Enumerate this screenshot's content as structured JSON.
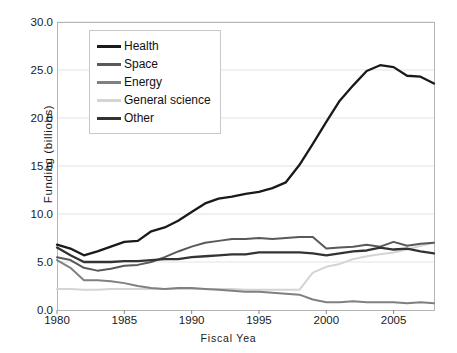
{
  "chart_data": {
    "type": "line",
    "title": "",
    "xlabel": "Fiscal Yea",
    "ylabel": "Funding (billions)",
    "xlim": [
      1980,
      2008
    ],
    "ylim": [
      0.0,
      30.0
    ],
    "grid": true,
    "legend_position": "top-left-inside",
    "x_ticks": [
      "1980",
      "1985",
      "1990",
      "1995",
      "2000",
      "2005"
    ],
    "x_tick_values": [
      1980,
      1985,
      1990,
      1995,
      2000,
      2005
    ],
    "y_ticks": [
      "0.0",
      "5.0",
      "10.0",
      "15.0",
      "20.0",
      "25.0",
      "30.0"
    ],
    "y_tick_values": [
      0.0,
      5.0,
      10.0,
      15.0,
      20.0,
      25.0,
      30.0
    ],
    "x": [
      1980,
      1981,
      1982,
      1983,
      1984,
      1985,
      1986,
      1987,
      1988,
      1989,
      1990,
      1991,
      1992,
      1993,
      1994,
      1995,
      1996,
      1997,
      1998,
      1999,
      2000,
      2001,
      2002,
      2003,
      2004,
      2005,
      2006,
      2007,
      2008
    ],
    "series": [
      {
        "name": "Health",
        "color": "#1a1a1a",
        "values": [
          6.8,
          6.4,
          5.7,
          6.1,
          6.6,
          7.1,
          7.2,
          8.2,
          8.6,
          9.3,
          10.2,
          11.1,
          11.6,
          11.8,
          12.1,
          12.3,
          12.7,
          13.3,
          15.1,
          17.3,
          19.6,
          21.8,
          23.4,
          24.9,
          25.5,
          25.3,
          24.4,
          24.3,
          23.6
        ]
      },
      {
        "name": "Space",
        "color": "#595959",
        "values": [
          5.5,
          5.2,
          4.4,
          4.1,
          4.3,
          4.6,
          4.7,
          5.0,
          5.5,
          6.1,
          6.6,
          7.0,
          7.2,
          7.4,
          7.4,
          7.5,
          7.4,
          7.5,
          7.6,
          7.6,
          6.4,
          6.5,
          6.6,
          6.8,
          6.6,
          7.1,
          6.7,
          6.9,
          7.0
        ]
      },
      {
        "name": "Energy",
        "color": "#808080",
        "values": [
          5.2,
          4.4,
          3.1,
          3.1,
          3.0,
          2.8,
          2.5,
          2.3,
          2.2,
          2.3,
          2.3,
          2.2,
          2.1,
          2.0,
          1.9,
          1.9,
          1.8,
          1.7,
          1.6,
          1.1,
          0.8,
          0.8,
          0.9,
          0.8,
          0.8,
          0.8,
          0.7,
          0.8,
          0.7
        ]
      },
      {
        "name": "General science",
        "color": "#d4d4d4",
        "values": [
          2.2,
          2.2,
          2.1,
          2.1,
          2.2,
          2.2,
          2.2,
          2.2,
          2.2,
          2.2,
          2.2,
          2.2,
          2.2,
          2.2,
          2.1,
          2.1,
          2.1,
          2.1,
          2.1,
          3.9,
          4.5,
          4.8,
          5.3,
          5.6,
          5.8,
          6.0,
          6.3,
          6.7,
          7.0
        ]
      },
      {
        "name": "Other",
        "color": "#333333",
        "values": [
          6.5,
          5.7,
          5.0,
          5.0,
          5.0,
          5.1,
          5.1,
          5.2,
          5.3,
          5.3,
          5.5,
          5.6,
          5.7,
          5.8,
          5.8,
          6.0,
          6.0,
          6.0,
          6.0,
          5.9,
          5.7,
          5.9,
          6.1,
          6.2,
          6.5,
          6.3,
          6.4,
          6.1,
          5.9
        ]
      }
    ]
  },
  "legend": {
    "items": [
      {
        "label": "Health"
      },
      {
        "label": "Space"
      },
      {
        "label": "Energy"
      },
      {
        "label": "General science"
      },
      {
        "label": "Other"
      }
    ]
  }
}
